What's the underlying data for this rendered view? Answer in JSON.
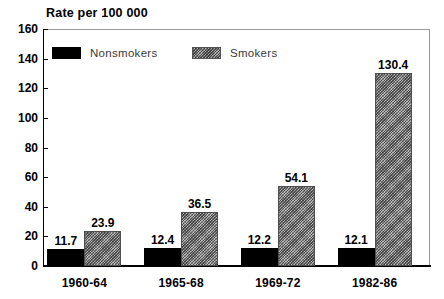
{
  "chart_data": {
    "type": "bar",
    "title": "Rate per 100 000",
    "xlabel": "",
    "ylabel": "",
    "ylim": [
      0,
      160
    ],
    "yticks": [
      0,
      20,
      40,
      60,
      80,
      100,
      120,
      140,
      160
    ],
    "grid": false,
    "legend_position": "top-left-inside",
    "categories": [
      "1960-64",
      "1965-68",
      "1969-72",
      "1982-86"
    ],
    "series": [
      {
        "name": "Nonsmokers",
        "color": "#000000",
        "fill": "solid-black",
        "values": [
          11.7,
          12.4,
          12.2,
          12.1
        ],
        "labels": [
          "11.7",
          "12.4",
          "12.2",
          "12.1"
        ]
      },
      {
        "name": "Smokers",
        "color": "#b9b9b9",
        "fill": "cross-hatch",
        "values": [
          23.9,
          36.5,
          54.1,
          130.4
        ],
        "labels": [
          "23.9",
          "36.5",
          "54.1",
          "130.4"
        ]
      }
    ]
  }
}
